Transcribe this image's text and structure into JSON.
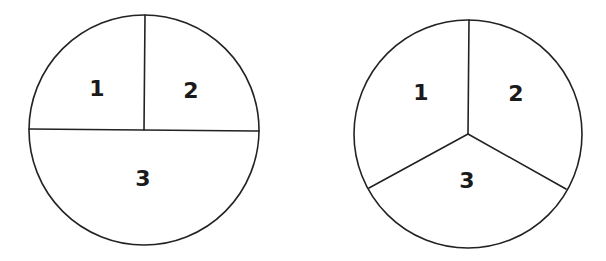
{
  "diagrams": [
    {
      "name": "circle-split-halves-quarters",
      "regions": [
        {
          "label": "1"
        },
        {
          "label": "2"
        },
        {
          "label": "3"
        }
      ]
    },
    {
      "name": "circle-split-thirds",
      "regions": [
        {
          "label": "1"
        },
        {
          "label": "2"
        },
        {
          "label": "3"
        }
      ]
    }
  ],
  "colors": {
    "stroke": "#222222",
    "text": "#1a1a1a",
    "background": "#ffffff"
  }
}
